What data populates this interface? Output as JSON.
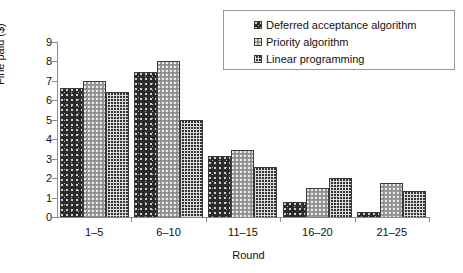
{
  "chart_data": {
    "type": "bar",
    "title": "",
    "xlabel": "Round",
    "ylabel": "Fine paid ($)",
    "categories": [
      "1–5",
      "6–10",
      "11–15",
      "16–20",
      "21–25"
    ],
    "series": [
      {
        "name": "Deferred acceptance algorithm",
        "values": [
          6.65,
          7.45,
          3.15,
          0.75,
          0.25
        ]
      },
      {
        "name": "Priority algorithm",
        "values": [
          7.0,
          8.0,
          3.45,
          1.5,
          1.75
        ]
      },
      {
        "name": "Linear programming",
        "values": [
          6.45,
          5.0,
          2.55,
          2.0,
          1.35
        ]
      }
    ],
    "ylim": [
      0,
      9
    ],
    "yticks": [
      "0",
      "1",
      "2",
      "3",
      "4",
      "5",
      "6",
      "7",
      "8",
      "9"
    ],
    "grid": false,
    "legend_position": "top-right"
  },
  "legend": {
    "items": [
      {
        "label": "Deferred acceptance algorithm",
        "swatch": "legend-swatch-deferred-acceptance"
      },
      {
        "label": "Priority algorithm",
        "swatch": "legend-swatch-priority"
      },
      {
        "label": "Linear programming",
        "swatch": "legend-swatch-linear-programming"
      }
    ]
  }
}
